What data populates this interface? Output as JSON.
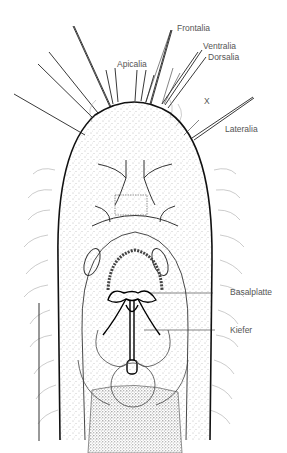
{
  "figure": {
    "type": "scientific-line-drawing",
    "colors": {
      "ink": "#1a1a1a",
      "label": "#555555",
      "background": "#ffffff",
      "stipple": "#6b6b6b"
    }
  },
  "labels": {
    "frontalia": "Frontalia",
    "ventralia": "Ventralia",
    "dorsalia": "Dorsalia",
    "apicalia": "Apicalia",
    "x": "X",
    "lateralia": "Lateralia",
    "basalplatte": "Basalplatte",
    "kiefer": "Kiefer"
  },
  "scale_bar": {
    "present": true,
    "orientation": "vertical"
  }
}
